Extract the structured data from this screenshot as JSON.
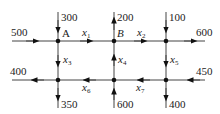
{
  "diagram": {
    "type": "traffic-flow-network",
    "nodes": [
      {
        "id": "A",
        "label": "A",
        "x": 58,
        "y": 41
      },
      {
        "id": "B",
        "label": "B",
        "x": 114,
        "y": 41
      },
      {
        "id": "C",
        "label": "",
        "x": 166,
        "y": 41
      },
      {
        "id": "D",
        "label": "",
        "x": 58,
        "y": 80
      },
      {
        "id": "E",
        "label": "",
        "x": 114,
        "y": 80
      },
      {
        "id": "F",
        "label": "",
        "x": 166,
        "y": 80
      }
    ],
    "external_flows": [
      {
        "value": "500",
        "node": "A",
        "direction": "in",
        "side": "left"
      },
      {
        "value": "300",
        "node": "A",
        "direction": "in",
        "side": "top"
      },
      {
        "value": "200",
        "node": "B",
        "direction": "out",
        "side": "top"
      },
      {
        "value": "100",
        "node": "C",
        "direction": "in",
        "side": "top"
      },
      {
        "value": "600",
        "node": "C",
        "direction": "out",
        "side": "right"
      },
      {
        "value": "400",
        "node": "D",
        "direction": "out",
        "side": "left"
      },
      {
        "value": "350",
        "node": "D",
        "direction": "out",
        "side": "bottom"
      },
      {
        "value": "600",
        "node": "E",
        "direction": "in",
        "side": "bottom"
      },
      {
        "value": "450",
        "node": "F",
        "direction": "in",
        "side": "right"
      },
      {
        "value": "400",
        "node": "F",
        "direction": "out",
        "side": "bottom"
      }
    ],
    "internal_flows": [
      {
        "var": "x",
        "sub": "1",
        "from": "A",
        "to": "B"
      },
      {
        "var": "x",
        "sub": "2",
        "from": "B",
        "to": "C"
      },
      {
        "var": "x",
        "sub": "3",
        "from": "A",
        "to": "D"
      },
      {
        "var": "x",
        "sub": "4",
        "from": "E",
        "to": "B"
      },
      {
        "var": "x",
        "sub": "5",
        "from": "C",
        "to": "F"
      },
      {
        "var": "x",
        "sub": "6",
        "from": "E",
        "to": "D"
      },
      {
        "var": "x",
        "sub": "7",
        "from": "F",
        "to": "E"
      }
    ],
    "labels": {
      "in_500": "500",
      "in_300": "300",
      "out_200": "200",
      "in_100": "100",
      "out_600": "600",
      "out_400_left": "400",
      "out_350": "350",
      "in_600": "600",
      "in_450": "450",
      "out_400_bottom": "400",
      "node_a": "A",
      "node_b": "B",
      "x": "x",
      "s1": "1",
      "s2": "2",
      "s3": "3",
      "s4": "4",
      "s5": "5",
      "s6": "6",
      "s7": "7"
    },
    "colors": {
      "line": "#444444",
      "node": "#111111",
      "text": "#222222"
    }
  }
}
